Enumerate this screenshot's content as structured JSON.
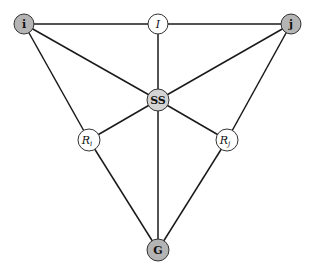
{
  "diagram": {
    "nodes": [
      {
        "id": "i",
        "label": "i",
        "sub": "",
        "style": "bold",
        "x": 24,
        "y": 24,
        "r": 10,
        "fill": "#b4b4b4"
      },
      {
        "id": "I",
        "label": "I",
        "sub": "",
        "style": "italic",
        "x": 158,
        "y": 24,
        "r": 10,
        "fill": "#ffffff"
      },
      {
        "id": "j",
        "label": "j",
        "sub": "",
        "style": "bold",
        "x": 291,
        "y": 24,
        "r": 10,
        "fill": "#b4b4b4"
      },
      {
        "id": "SS",
        "label": "SS",
        "sub": "",
        "style": "bold",
        "x": 158,
        "y": 100,
        "r": 11,
        "fill": "#d4d4d4"
      },
      {
        "id": "Ri",
        "label": "R",
        "sub": "i",
        "style": "italic",
        "x": 89,
        "y": 140,
        "r": 11,
        "fill": "#ffffff"
      },
      {
        "id": "Rj",
        "label": "R",
        "sub": "j",
        "style": "italic",
        "x": 227,
        "y": 140,
        "r": 11,
        "fill": "#ffffff"
      },
      {
        "id": "G",
        "label": "G",
        "sub": "",
        "style": "bold",
        "x": 158,
        "y": 250,
        "r": 11,
        "fill": "#b4b4b4"
      }
    ],
    "edges": [
      [
        "i",
        "I"
      ],
      [
        "I",
        "j"
      ],
      [
        "I",
        "SS"
      ],
      [
        "i",
        "SS"
      ],
      [
        "j",
        "SS"
      ],
      [
        "i",
        "Ri"
      ],
      [
        "j",
        "Rj"
      ],
      [
        "SS",
        "Ri"
      ],
      [
        "SS",
        "Rj"
      ],
      [
        "SS",
        "G"
      ],
      [
        "Ri",
        "G"
      ],
      [
        "Rj",
        "G"
      ]
    ]
  }
}
